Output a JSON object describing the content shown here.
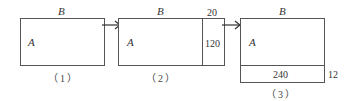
{
  "panels": [
    {
      "caption": "（1）",
      "top_label": "B",
      "inner_label": "A"
    },
    {
      "caption": "（2）",
      "top_label": "B",
      "inner_label": "A",
      "strip_width_label": "20",
      "strip_height_label": "120"
    },
    {
      "caption": "（3）",
      "top_label": "B",
      "inner_label": "A",
      "strip_length_label": "240",
      "strip_height_label": "12"
    }
  ],
  "arrows": [
    "panel1-to-panel2",
    "panel2-to-panel3"
  ],
  "colors": {
    "line": "#555555",
    "text": "#333333"
  }
}
